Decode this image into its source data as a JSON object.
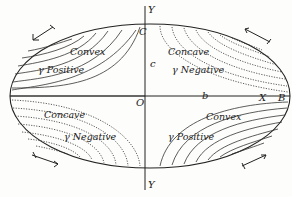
{
  "diagram": {
    "axes": {
      "y_top": "Y",
      "y_bottom": "Y",
      "x_label": "X",
      "origin": "O",
      "point_b": "b",
      "point_c": "c",
      "point_B": "B",
      "point_C": "C"
    },
    "quadrants": {
      "top_left": {
        "curvature": "Convex",
        "gamma": "γ Positive",
        "line_style": "solid"
      },
      "top_right": {
        "curvature": "Concave",
        "gamma": "γ Negative",
        "line_style": "dotted"
      },
      "bottom_left": {
        "curvature": "Concave",
        "gamma": "γ Negative",
        "line_style": "dotted"
      },
      "bottom_right": {
        "curvature": "Convex",
        "gamma": "γ Positive",
        "line_style": "solid"
      }
    },
    "arrows": [
      {
        "position": "top-left",
        "direction": "down-left"
      },
      {
        "position": "top-right",
        "direction": "up-left"
      },
      {
        "position": "bottom-left",
        "direction": "down-right"
      },
      {
        "position": "bottom-right",
        "direction": "up-right"
      }
    ],
    "colors": {
      "ink": "#222222",
      "paper": "#fdfdfb"
    }
  }
}
